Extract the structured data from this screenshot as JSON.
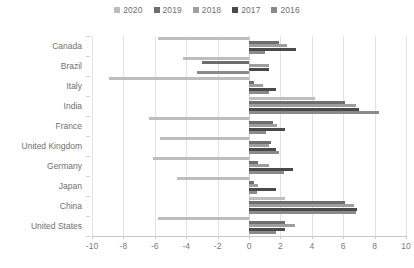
{
  "chart_data": {
    "type": "bar",
    "orientation": "horizontal",
    "title": "",
    "xlabel": "",
    "ylabel": "",
    "xlim": [
      -10,
      10
    ],
    "xticks": [
      -10,
      -8,
      -6,
      -4,
      -2,
      0,
      2,
      4,
      6,
      8,
      10
    ],
    "xtick_labels": [
      "-10",
      "-8",
      "-6",
      "-4",
      "-2",
      "0",
      "2",
      "4",
      "6",
      "8",
      "10"
    ],
    "grid": true,
    "legend_position": "top-center",
    "categories": [
      "Canada",
      "Brazil",
      "Italy",
      "India",
      "France",
      "United Kingdom",
      "Germany",
      "Japan",
      "China",
      "United States"
    ],
    "series": [
      {
        "name": "2020",
        "color": "#bdbdbd",
        "values": [
          -5.8,
          -4.2,
          -8.9,
          4.2,
          -6.4,
          -5.7,
          -6.1,
          -4.6,
          2.3,
          -5.8
        ]
      },
      {
        "name": "2019",
        "color": "#6e6e6e",
        "values": [
          1.9,
          -3.0,
          0.3,
          6.1,
          1.5,
          1.4,
          0.6,
          0.3,
          6.1,
          2.3
        ]
      },
      {
        "name": "2018",
        "color": "#9e9e9e",
        "values": [
          2.4,
          1.3,
          0.9,
          6.8,
          1.8,
          1.3,
          1.3,
          0.6,
          6.7,
          2.9
        ]
      },
      {
        "name": "2017",
        "color": "#4a4a4a",
        "values": [
          3.0,
          1.3,
          1.7,
          7.0,
          2.3,
          1.7,
          2.8,
          1.7,
          6.9,
          2.3
        ]
      },
      {
        "name": "2016",
        "color": "#8a8a8a",
        "values": [
          1.0,
          -3.3,
          1.3,
          8.3,
          1.1,
          1.9,
          2.2,
          0.5,
          6.8,
          1.7
        ]
      }
    ]
  },
  "legend": {
    "items": [
      {
        "label": "2020",
        "color": "#bdbdbd"
      },
      {
        "label": "2019",
        "color": "#6e6e6e"
      },
      {
        "label": "2018",
        "color": "#9e9e9e"
      },
      {
        "label": "2017",
        "color": "#4a4a4a"
      },
      {
        "label": "2016",
        "color": "#8a8a8a"
      }
    ]
  }
}
